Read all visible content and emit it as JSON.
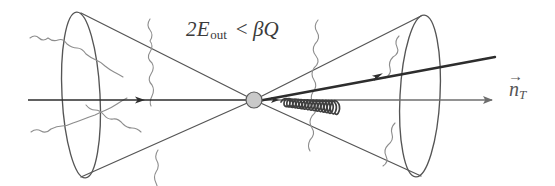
{
  "figure": {
    "background_color": "#ffffff",
    "width": 555,
    "height": 186,
    "labels": {
      "constraint": {
        "full_text": "2E_out < BQ",
        "coefficient": "2",
        "energy_symbol": "E",
        "energy_subscript": "out",
        "relation": "<",
        "beta_symbol": "β",
        "q_symbol": "Q"
      },
      "axis": {
        "full_text": "n_T",
        "vector_symbol": "n",
        "vector_accent": "→",
        "subscript": "T"
      }
    },
    "colors": {
      "hard_line": "#2d2d2d",
      "thrust_axis_right": "#6e6e6e",
      "cone_outline": "#555555",
      "ellipse_outline": "#555555",
      "soft_radiation": "#888888",
      "gluon_coil": "#444444",
      "vertex_fill": "#c9c9c9",
      "vertex_stroke": "#555555",
      "text": "#3b3b3b"
    },
    "elements": {
      "left_cone_label": "left-hemisphere-cone",
      "right_cone_label": "right-hemisphere-cone",
      "left_ellipse_label": "left-cone-base-ellipse",
      "right_ellipse_label": "right-cone-base-ellipse",
      "vertex_label": "interaction-vertex",
      "incoming_label": "incoming-beam-arrow",
      "thrust_axis_label": "thrust-axis-arrow",
      "quark_jet_label": "quark-jet-arrow",
      "gluon_label": "gluon-coil",
      "soft_count": 8
    }
  }
}
